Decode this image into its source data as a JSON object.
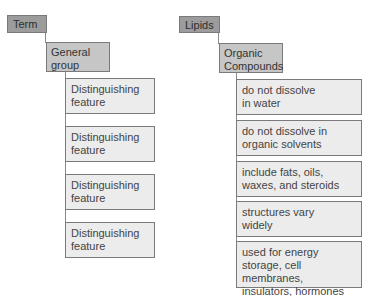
{
  "template": {
    "term": "Term",
    "group": "General\ngroup",
    "features": [
      "Distinguishing\nfeature",
      "Distinguishing\nfeature",
      "Distinguishing\nfeature",
      "Distinguishing\nfeature"
    ]
  },
  "example": {
    "term": "Lipids",
    "group": "Organic\nCompounds",
    "features": [
      "do not dissolve\nin water",
      "do not dissolve in\norganic solvents",
      "include fats, oils,\nwaxes, and steroids",
      "structures vary\nwidely",
      "used for energy\nstorage, cell membranes,\ninsulators, hormones"
    ]
  },
  "colors": {
    "term_fill": "#9c9c9c",
    "group_fill": "#c6c6c6",
    "feature_fill": "#ececec",
    "border": "#7a7a7a"
  }
}
